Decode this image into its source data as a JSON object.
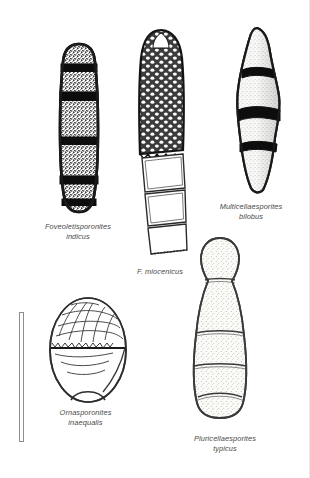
{
  "plate": {
    "background_color": "#ffffff",
    "ink_color": "#1a1a1a",
    "label_color": "#4a4a4a",
    "caption_style": "italic"
  },
  "scale_bar": {
    "name": "scale-bar",
    "orientation": "vertical",
    "label": ""
  },
  "specimens": [
    {
      "id": "foveoletisporonites-indicus",
      "genus": "Foveoletisporonites",
      "species": "indicus",
      "position": "top-left",
      "cells": 6,
      "septa": 5,
      "shape": "elongate-fusiform",
      "ornament": "foveolate-speckled",
      "septa_style": "thick-dark"
    },
    {
      "id": "f-miocenicus",
      "genus": "F.",
      "species": "miocenicus",
      "position": "top-center",
      "cells": 7,
      "septa": 6,
      "shape": "elongate-clavate",
      "ornament": "reticulate-foveolate",
      "septa_style": "thin-outline"
    },
    {
      "id": "multicellaesporites-bilobus",
      "genus": "Multicellaesporites",
      "species": "bilobus",
      "position": "top-right",
      "cells": 4,
      "septa": 3,
      "shape": "fusiform-lobed",
      "ornament": "granulate-shaded",
      "septa_style": "thick-dark"
    },
    {
      "id": "ornasporonites-inaequalis",
      "genus": "Ornasporonites",
      "species": "inaequalis",
      "position": "bottom-left",
      "cells": 2,
      "septa": 1,
      "shape": "ovoid",
      "ornament": "reticulate-upper-half",
      "septa_style": "thin-dark"
    },
    {
      "id": "pluricellaesporites-typicus",
      "genus": "Pluricellaesporites",
      "species": "typicus",
      "position": "bottom-right",
      "cells": 5,
      "septa": 4,
      "shape": "clavate-pyriform",
      "ornament": "finely-stippled",
      "septa_style": "thin-outline"
    }
  ]
}
